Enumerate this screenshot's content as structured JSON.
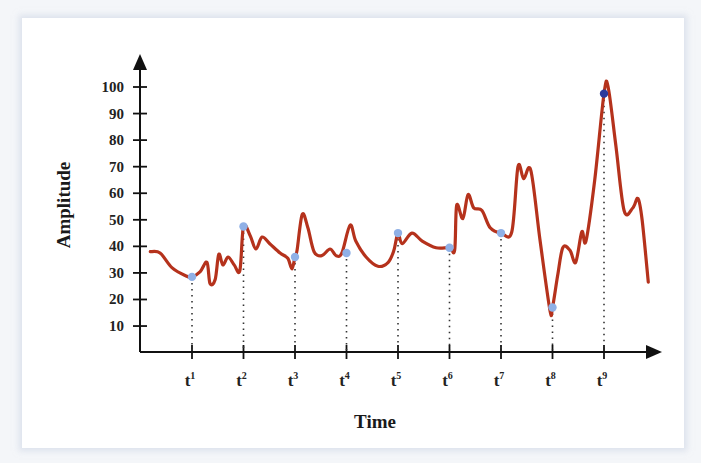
{
  "chart_data": {
    "type": "line",
    "title": "",
    "xlabel": "Time",
    "ylabel": "Amplitude",
    "ylim": [
      0,
      100
    ],
    "xlim": [
      0,
      10
    ],
    "y_ticks": [
      10,
      20,
      30,
      40,
      50,
      60,
      70,
      80,
      90,
      100
    ],
    "x_ticks": [
      {
        "base": "t",
        "sup": "1",
        "x": 1
      },
      {
        "base": "t",
        "sup": "2",
        "x": 2
      },
      {
        "base": "t",
        "sup": "3",
        "x": 3
      },
      {
        "base": "t",
        "sup": "4",
        "x": 4
      },
      {
        "base": "t",
        "sup": "5",
        "x": 5
      },
      {
        "base": "t",
        "sup": "6",
        "x": 6
      },
      {
        "base": "t",
        "sup": "7",
        "x": 7
      },
      {
        "base": "t",
        "sup": "8",
        "x": 8
      },
      {
        "base": "t",
        "sup": "9",
        "x": 9
      }
    ],
    "grid": false,
    "series": [
      {
        "name": "signal",
        "color": "#b5321c",
        "points": [
          [
            0.19,
            38
          ],
          [
            0.38,
            37.5
          ],
          [
            0.61,
            32
          ],
          [
            0.87,
            29
          ],
          [
            1.0,
            28.5
          ],
          [
            1.16,
            30.5
          ],
          [
            1.29,
            34
          ],
          [
            1.35,
            26
          ],
          [
            1.45,
            27.5
          ],
          [
            1.52,
            37
          ],
          [
            1.6,
            33
          ],
          [
            1.7,
            36
          ],
          [
            1.82,
            33
          ],
          [
            1.93,
            31
          ],
          [
            2.0,
            47.5
          ],
          [
            2.13,
            44
          ],
          [
            2.24,
            39
          ],
          [
            2.36,
            43.5
          ],
          [
            2.51,
            41
          ],
          [
            2.71,
            37.5
          ],
          [
            2.86,
            35.5
          ],
          [
            2.94,
            31.5
          ],
          [
            3.0,
            36
          ],
          [
            3.04,
            38.5
          ],
          [
            3.14,
            52
          ],
          [
            3.25,
            47
          ],
          [
            3.37,
            38
          ],
          [
            3.52,
            36.5
          ],
          [
            3.68,
            39
          ],
          [
            3.8,
            36.5
          ],
          [
            3.91,
            37.5
          ],
          [
            4.07,
            48
          ],
          [
            4.18,
            42
          ],
          [
            4.38,
            36
          ],
          [
            4.61,
            32.5
          ],
          [
            4.81,
            34
          ],
          [
            4.92,
            38.5
          ],
          [
            5.0,
            45
          ],
          [
            5.08,
            41
          ],
          [
            5.27,
            45
          ],
          [
            5.47,
            42
          ],
          [
            5.74,
            39.5
          ],
          [
            6.0,
            39.5
          ],
          [
            6.1,
            38.5
          ],
          [
            6.14,
            55.5
          ],
          [
            6.26,
            50.5
          ],
          [
            6.36,
            59.5
          ],
          [
            6.47,
            54.5
          ],
          [
            6.63,
            53.5
          ],
          [
            6.79,
            47
          ],
          [
            7.0,
            45
          ],
          [
            7.21,
            45.5
          ],
          [
            7.33,
            70
          ],
          [
            7.44,
            65.5
          ],
          [
            7.58,
            68.5
          ],
          [
            7.76,
            42
          ],
          [
            7.95,
            16
          ],
          [
            8.0,
            17
          ],
          [
            8.1,
            29
          ],
          [
            8.2,
            39.5
          ],
          [
            8.34,
            38.5
          ],
          [
            8.45,
            34
          ],
          [
            8.57,
            45.5
          ],
          [
            8.65,
            42
          ],
          [
            8.82,
            65
          ],
          [
            9.0,
            97.5
          ],
          [
            9.08,
            100
          ],
          [
            9.23,
            78
          ],
          [
            9.39,
            53.5
          ],
          [
            9.56,
            54.5
          ],
          [
            9.66,
            58
          ],
          [
            9.74,
            50
          ],
          [
            9.86,
            26.5
          ]
        ]
      }
    ],
    "markers": [
      {
        "x": 1,
        "y": 28.5,
        "color": "#8fb0e6"
      },
      {
        "x": 2,
        "y": 47.5,
        "color": "#8fb0e6"
      },
      {
        "x": 3,
        "y": 36,
        "color": "#8fb0e6"
      },
      {
        "x": 4,
        "y": 37.5,
        "color": "#8fb0e6"
      },
      {
        "x": 5,
        "y": 45,
        "color": "#8fb0e6"
      },
      {
        "x": 6,
        "y": 39.5,
        "color": "#8fb0e6"
      },
      {
        "x": 7,
        "y": 45,
        "color": "#8fb0e6"
      },
      {
        "x": 8,
        "y": 17,
        "color": "#8fb0e6"
      },
      {
        "x": 9,
        "y": 97.5,
        "color": "#2b3a9c"
      }
    ],
    "drop_lines": "dotted from each marker to x-axis"
  }
}
